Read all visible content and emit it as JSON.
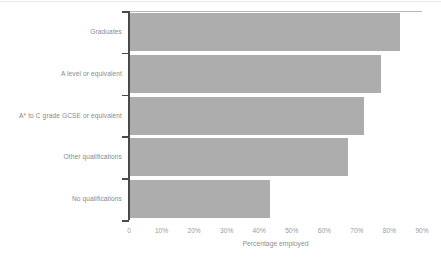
{
  "chart_data": {
    "type": "bar",
    "orientation": "horizontal",
    "title": "",
    "subtitle": "",
    "xlabel": "Percentage employed",
    "ylabel": "",
    "categories": [
      "Graduates",
      "A level or equivalent",
      "A* to C grade GCSE or equivalent",
      "Other qualifications",
      "No qualifications"
    ],
    "values": [
      83,
      77,
      72,
      67,
      43
    ],
    "value_unit": "%",
    "xlim": [
      0,
      90
    ],
    "xticks": [
      0,
      10,
      20,
      30,
      40,
      50,
      60,
      70,
      80,
      90
    ],
    "xticklabels": [
      "0",
      "10%",
      "20%",
      "30%",
      "40%",
      "50%",
      "60%",
      "70%",
      "80%",
      "90%"
    ],
    "grid": false,
    "legend": null,
    "bar_color": "#adadad",
    "axis_color": "#4a4a4a",
    "label_color": "#8a8a8a"
  },
  "axis": {
    "x_title": "Percentage employed"
  }
}
